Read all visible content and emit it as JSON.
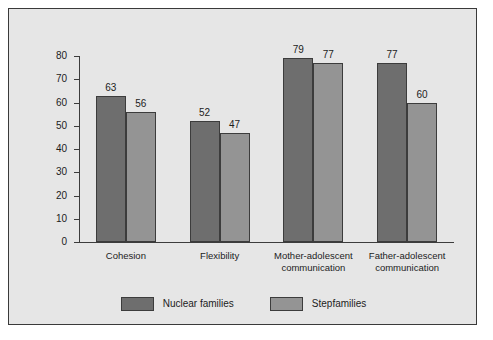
{
  "chart_data": {
    "type": "bar",
    "title": "",
    "subtitle": "",
    "xlabel": "",
    "ylabel": "",
    "ylim": [
      0,
      80
    ],
    "grid": false,
    "legend_position": "bottom-center",
    "yticks": [
      0,
      10,
      20,
      30,
      40,
      50,
      60,
      70,
      80
    ],
    "ytick_labels": [
      "0",
      "10",
      "20",
      "30",
      "40",
      "50",
      "60",
      "70",
      "80"
    ],
    "categories": [
      "Cohesion",
      "Flexibility",
      "Mother-adolescent communication",
      "Father-adolescent communication"
    ],
    "category_lines": [
      [
        "Cohesion"
      ],
      [
        "Flexibility"
      ],
      [
        "Mother-adolescent",
        "communication"
      ],
      [
        "Father-adolescent",
        "communication"
      ]
    ],
    "series": [
      {
        "name": "Nuclear families",
        "color": "#6e6e6e",
        "values": [
          63,
          52,
          79,
          77
        ],
        "labels": [
          "63",
          "52",
          "79",
          "77"
        ]
      },
      {
        "name": "Stepfamilies",
        "color": "#949494",
        "values": [
          56,
          47,
          77,
          60
        ],
        "labels": [
          "56",
          "47",
          "77",
          "60"
        ]
      }
    ]
  },
  "figure": {
    "background_color": "#e6e6e6",
    "border_color": "#3a3a3a",
    "axis_color": "#3c3c3c",
    "text_color": "#1c1c1c"
  }
}
